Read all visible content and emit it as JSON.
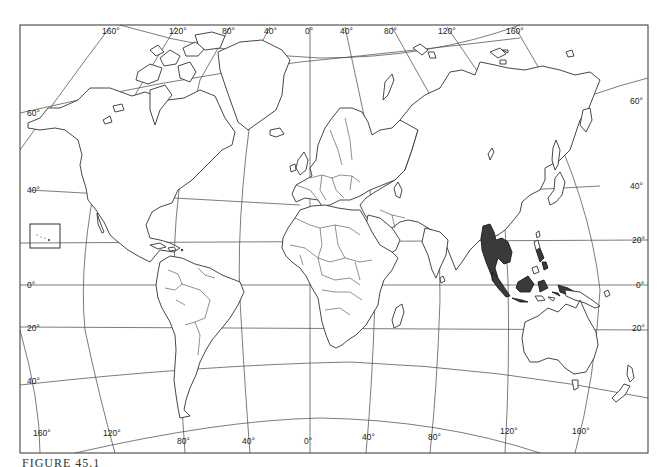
{
  "figure": {
    "caption": "FIGURE 45.1",
    "type": "world outline map",
    "highlighted_region": "Southeast Asia",
    "highlight_color": "#3a3a3a",
    "line_color": "#333333",
    "background": "#ffffff"
  },
  "longitude_labels_top": [
    "160°",
    "120°",
    "80°",
    "40°",
    "0°",
    "40°",
    "80°",
    "120°",
    "160°"
  ],
  "longitude_labels_bottom": [
    "160°",
    "120°",
    "80°",
    "40°",
    "0°",
    "40°",
    "80°",
    "120°",
    "160°"
  ],
  "latitude_labels_left": [
    "60°",
    "40°",
    "0°",
    "20°",
    "40°"
  ],
  "latitude_labels_right": [
    "60°",
    "40°",
    "20°",
    "0°",
    "20°"
  ],
  "inset": {
    "name": "Hawaii inset box"
  }
}
